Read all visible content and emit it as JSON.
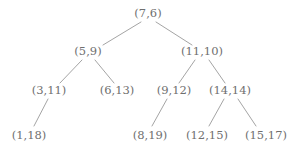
{
  "diagram": {
    "type": "tree",
    "background_color": "#ffffff",
    "node_text_color": "#6f6f6f",
    "edge_color": "#9a9a9a",
    "edge_width": 0.9,
    "nodes": [
      {
        "id": "n0",
        "label": "(7,6)",
        "x": 148,
        "y": 14,
        "depth": 0,
        "parent": null,
        "side": "root"
      },
      {
        "id": "n1",
        "label": "(5,9)",
        "x": 88,
        "y": 52,
        "depth": 1,
        "parent": "n0",
        "side": "left"
      },
      {
        "id": "n2",
        "label": "(11,10)",
        "x": 202,
        "y": 52,
        "depth": 1,
        "parent": "n0",
        "side": "right"
      },
      {
        "id": "n3",
        "label": "(3,11)",
        "x": 49,
        "y": 91,
        "depth": 2,
        "parent": "n1",
        "side": "left"
      },
      {
        "id": "n4",
        "label": "(6,13)",
        "x": 117,
        "y": 91,
        "depth": 2,
        "parent": "n1",
        "side": "right"
      },
      {
        "id": "n5",
        "label": "(9,12)",
        "x": 174,
        "y": 91,
        "depth": 2,
        "parent": "n2",
        "side": "left"
      },
      {
        "id": "n6",
        "label": "(14,14)",
        "x": 230,
        "y": 91,
        "depth": 2,
        "parent": "n2",
        "side": "right"
      },
      {
        "id": "n7",
        "label": "(1,18)",
        "x": 29,
        "y": 136,
        "depth": 3,
        "parent": "n3",
        "side": "left"
      },
      {
        "id": "n8",
        "label": "(8,19)",
        "x": 150,
        "y": 136,
        "depth": 3,
        "parent": "n5",
        "side": "left"
      },
      {
        "id": "n9",
        "label": "(12,15)",
        "x": 207,
        "y": 136,
        "depth": 3,
        "parent": "n6",
        "side": "left"
      },
      {
        "id": "n10",
        "label": "(15,17)",
        "x": 266,
        "y": 136,
        "depth": 3,
        "parent": "n6",
        "side": "right"
      }
    ],
    "edges": [
      {
        "from": "n0",
        "to": "n1",
        "x1": 141,
        "y1": 22,
        "x2": 103,
        "y2": 45
      },
      {
        "from": "n0",
        "to": "n2",
        "x1": 156,
        "y1": 22,
        "x2": 192,
        "y2": 45
      },
      {
        "from": "n1",
        "to": "n3",
        "x1": 82,
        "y1": 60,
        "x2": 60,
        "y2": 83
      },
      {
        "from": "n1",
        "to": "n4",
        "x1": 95,
        "y1": 60,
        "x2": 114,
        "y2": 83
      },
      {
        "from": "n2",
        "to": "n5",
        "x1": 195,
        "y1": 60,
        "x2": 179,
        "y2": 83
      },
      {
        "from": "n2",
        "to": "n6",
        "x1": 209,
        "y1": 60,
        "x2": 225,
        "y2": 83
      },
      {
        "from": "n3",
        "to": "n7",
        "x1": 48,
        "y1": 99,
        "x2": 34,
        "y2": 126
      },
      {
        "from": "n5",
        "to": "n8",
        "x1": 167,
        "y1": 99,
        "x2": 152,
        "y2": 126
      },
      {
        "from": "n6",
        "to": "n9",
        "x1": 224,
        "y1": 99,
        "x2": 209,
        "y2": 126
      },
      {
        "from": "n6",
        "to": "n10",
        "x1": 238,
        "y1": 99,
        "x2": 256,
        "y2": 126
      }
    ]
  }
}
